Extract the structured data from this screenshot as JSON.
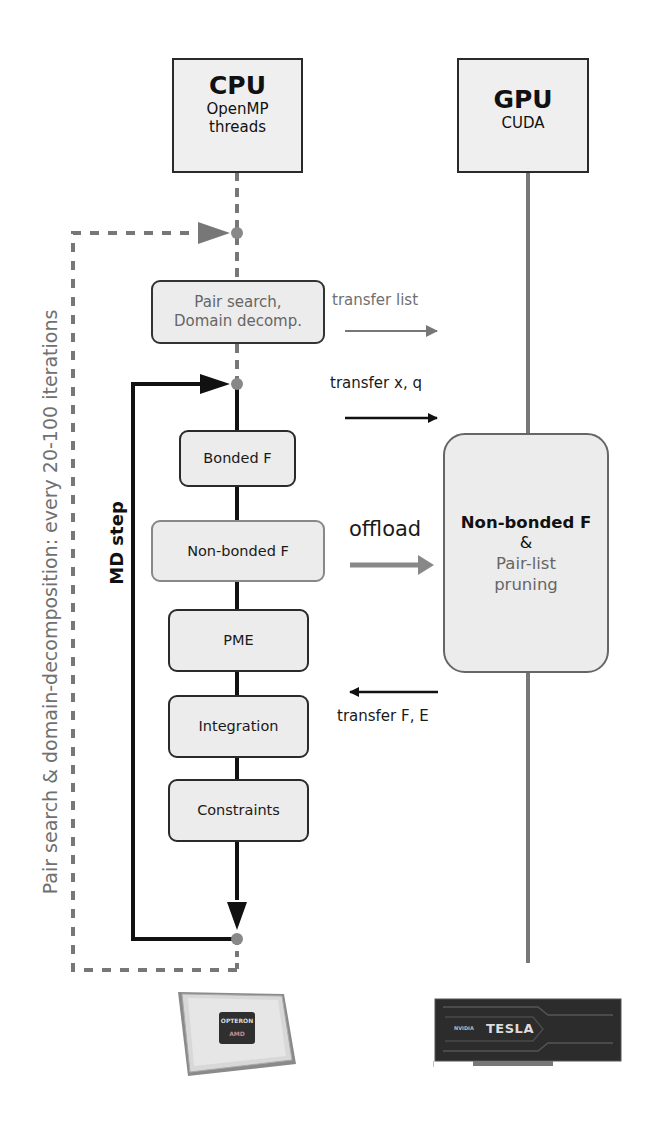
{
  "columns": {
    "cpu": {
      "title": "CPU",
      "subtitle_line1": "OpenMP",
      "subtitle_line2": "threads"
    },
    "gpu": {
      "title": "GPU",
      "subtitle": "CUDA"
    }
  },
  "outer_loop": {
    "label": "Pair search & domain-decomposition: every 20-100 iterations",
    "style": "dashed",
    "color": "#777777"
  },
  "md_loop": {
    "label": "MD step",
    "color": "#111111"
  },
  "cpu_steps": [
    {
      "id": "pair-search",
      "line1": "Pair search,",
      "line2": "Domain decomp."
    },
    {
      "id": "bonded",
      "label": "Bonded F"
    },
    {
      "id": "nonbonded",
      "label": "Non-bonded F"
    },
    {
      "id": "pme",
      "label": "PME"
    },
    {
      "id": "integration",
      "label": "Integration"
    },
    {
      "id": "constraints",
      "label": "Constraints"
    }
  ],
  "gpu_task": {
    "main": "Non-bonded F",
    "amp": "&",
    "sub_line1": "Pair-list",
    "sub_line2": "pruning"
  },
  "transfers": [
    {
      "label": "transfer list",
      "direction": "cpu-to-gpu",
      "color": "#777777"
    },
    {
      "label": "transfer x, q",
      "direction": "cpu-to-gpu",
      "color": "#111111"
    },
    {
      "label": "offload",
      "direction": "cpu-to-gpu",
      "color": "#888888"
    },
    {
      "label": "transfer F, E",
      "direction": "gpu-to-cpu",
      "color": "#111111"
    }
  ],
  "hardware": {
    "cpu_chip": {
      "brand_line1": "OPTERON",
      "brand_line2": "AMD"
    },
    "gpu_card": {
      "brand": "NVIDIA",
      "name": "TESLA"
    }
  },
  "colors": {
    "box_fill": "#ececec",
    "dark_line": "#111111",
    "gray_line": "#777777",
    "gray_text": "#666666"
  }
}
